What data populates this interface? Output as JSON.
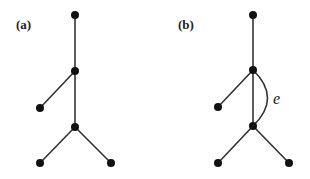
{
  "panels": [
    {
      "label": "(a)",
      "nodes": [
        {
          "id": "top",
          "x": 75,
          "y": 15
        },
        {
          "id": "mid",
          "x": 75,
          "y": 71
        },
        {
          "id": "left",
          "x": 40,
          "y": 108
        },
        {
          "id": "lower",
          "x": 75,
          "y": 127
        },
        {
          "id": "bottom-left",
          "x": 40,
          "y": 163
        },
        {
          "id": "bottom-right",
          "x": 111,
          "y": 163
        }
      ],
      "edges": [
        [
          "top",
          "mid"
        ],
        [
          "mid",
          "left"
        ],
        [
          "mid",
          "lower"
        ],
        [
          "lower",
          "bottom-left"
        ],
        [
          "lower",
          "bottom-right"
        ]
      ]
    },
    {
      "label": "(b)",
      "edge_label": "e",
      "nodes": [
        {
          "id": "top",
          "x": 253,
          "y": 15
        },
        {
          "id": "mid",
          "x": 253,
          "y": 70
        },
        {
          "id": "left",
          "x": 218,
          "y": 107
        },
        {
          "id": "lower",
          "x": 253,
          "y": 126
        },
        {
          "id": "bottom-left",
          "x": 218,
          "y": 163
        },
        {
          "id": "bottom-right",
          "x": 289,
          "y": 163
        }
      ],
      "edges": [
        [
          "top",
          "mid"
        ],
        [
          "mid",
          "left"
        ],
        [
          "mid",
          "lower"
        ],
        [
          "lower",
          "bottom-left"
        ],
        [
          "lower",
          "bottom-right"
        ]
      ],
      "extra_edge": {
        "from": "mid",
        "to": "lower",
        "curved": true,
        "label": "e"
      }
    }
  ]
}
